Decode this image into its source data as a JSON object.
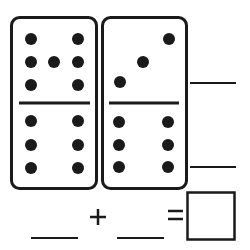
{
  "worksheet": {
    "type": "domino addition",
    "ink_color": "#1a1a1a",
    "background": "#ffffff",
    "dominoes": [
      {
        "id": "left",
        "top_pips": 7,
        "bottom_pips": 6,
        "top_dots": [
          [
            31,
            39
          ],
          [
            78,
            39
          ],
          [
            31,
            62
          ],
          [
            54,
            62
          ],
          [
            78,
            62
          ],
          [
            31,
            85
          ],
          [
            78,
            85
          ]
        ],
        "bottom_dots": [
          [
            31,
            121
          ],
          [
            78,
            121
          ],
          [
            31,
            145
          ],
          [
            78,
            145
          ],
          [
            31,
            168
          ],
          [
            78,
            168
          ]
        ]
      },
      {
        "id": "right",
        "top_pips": 3,
        "bottom_pips": 6,
        "top_dots": [
          [
            169,
            39
          ],
          [
            143,
            62
          ],
          [
            120,
            82
          ]
        ],
        "bottom_dots": [
          [
            119,
            122
          ],
          [
            168,
            122
          ],
          [
            119,
            145
          ],
          [
            168,
            145
          ],
          [
            119,
            167
          ],
          [
            168,
            167
          ]
        ]
      }
    ],
    "side_answers": {
      "top": "",
      "bottom": ""
    },
    "equation": {
      "addend_1": "",
      "operator": "+",
      "addend_2": "",
      "equals": "=",
      "sum": ""
    }
  }
}
